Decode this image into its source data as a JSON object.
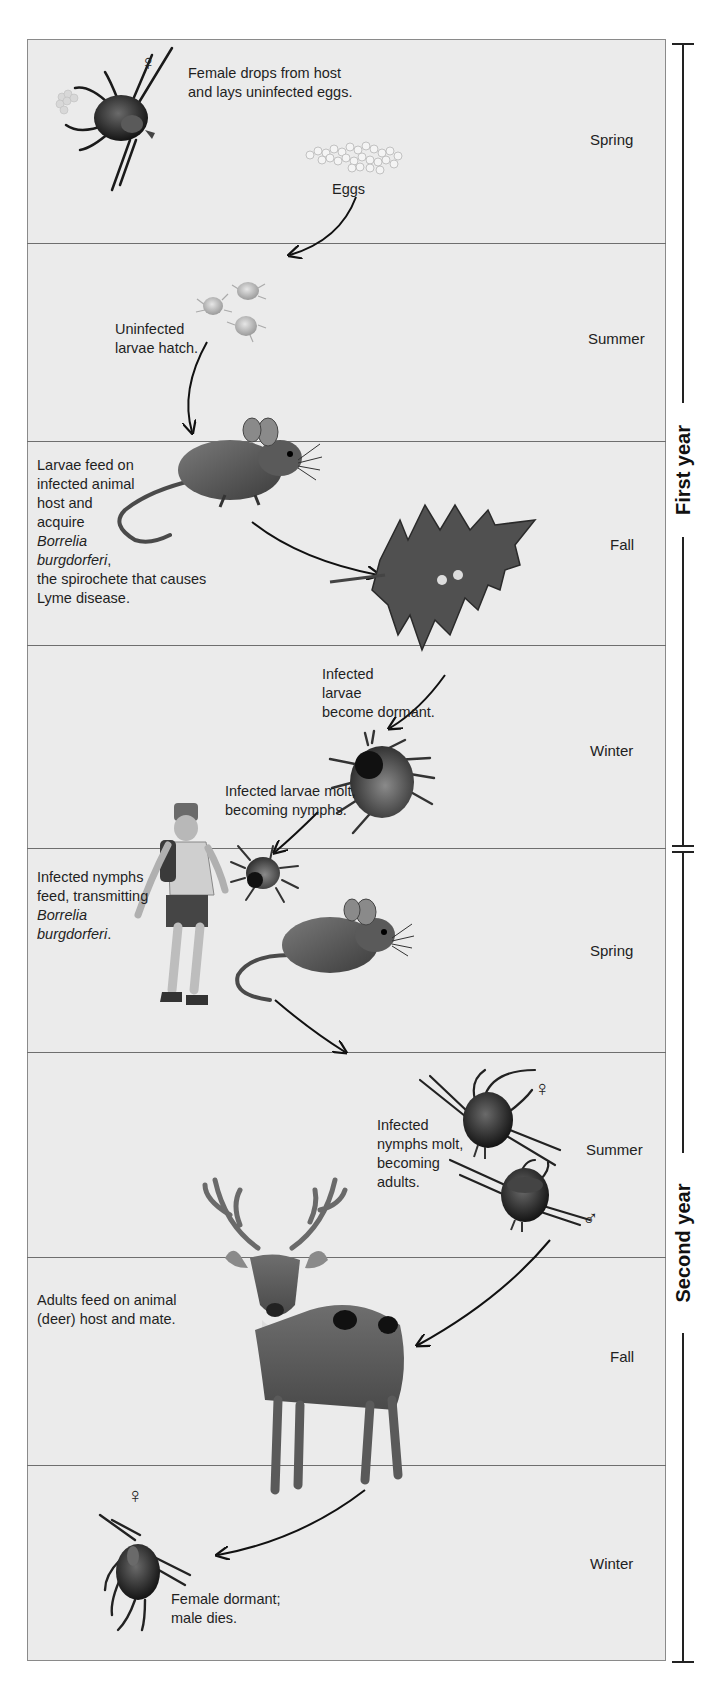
{
  "diagram": {
    "title_labels": {
      "first_year": "First year",
      "second_year": "Second year"
    },
    "seasons": [
      {
        "id": "spring-1",
        "label": "Spring",
        "year": "First year"
      },
      {
        "id": "summer-1",
        "label": "Summer",
        "year": "First year"
      },
      {
        "id": "fall-1",
        "label": "Fall",
        "year": "First year"
      },
      {
        "id": "winter-1",
        "label": "Winter",
        "year": "First year"
      },
      {
        "id": "spring-2",
        "label": "Spring",
        "year": "Second year"
      },
      {
        "id": "summer-2",
        "label": "Summer",
        "year": "Second year"
      },
      {
        "id": "fall-2",
        "label": "Fall",
        "year": "Second year"
      },
      {
        "id": "winter-2",
        "label": "Winter",
        "year": "Second year"
      }
    ],
    "captions": {
      "female_drops": [
        "Female drops from host",
        "and lays uninfected eggs."
      ],
      "eggs": "Eggs",
      "larvae_hatch": [
        "Uninfected",
        "larvae hatch."
      ],
      "larvae_feed": {
        "lines": [
          "Larvae feed on",
          "infected animal",
          "host and",
          "acquire"
        ],
        "italic": [
          "Borrelia",
          "burgdorferi"
        ],
        "after_italic": ",",
        "tail": [
          "the spirochete that causes",
          "Lyme disease."
        ]
      },
      "larvae_dormant": [
        "Infected",
        "larvae",
        "become dormant."
      ],
      "larvae_molt": [
        "Infected larvae molt,",
        "becoming nymphs."
      ],
      "nymphs_feed": {
        "lines": [
          "Infected nymphs",
          "feed, transmitting"
        ],
        "italic": [
          "Borrelia",
          "burgdorferi"
        ],
        "after_italic": "."
      },
      "nymphs_molt": [
        "Infected",
        "nymphs molt,",
        "becoming",
        "adults."
      ],
      "adults_feed": [
        "Adults feed on animal",
        "(deer) host and mate."
      ],
      "female_dormant": [
        "Female dormant;",
        "male dies."
      ]
    },
    "symbols": {
      "female": "♀",
      "male": "♂"
    },
    "illustrations": [
      "female-tick",
      "egg-cluster",
      "larvae",
      "mouse",
      "oak-leaf",
      "nymph-tick",
      "hiker",
      "nymph-tick-small",
      "mouse-2",
      "adult-female-tick",
      "adult-male-tick",
      "deer",
      "dormant-female-tick"
    ],
    "colors": {
      "panel_fill": "#ebebeb",
      "panel_border": "#8a8a8a",
      "divider": "#6e6e6e",
      "text": "#1f1f1f",
      "bracket": "#222222"
    }
  }
}
